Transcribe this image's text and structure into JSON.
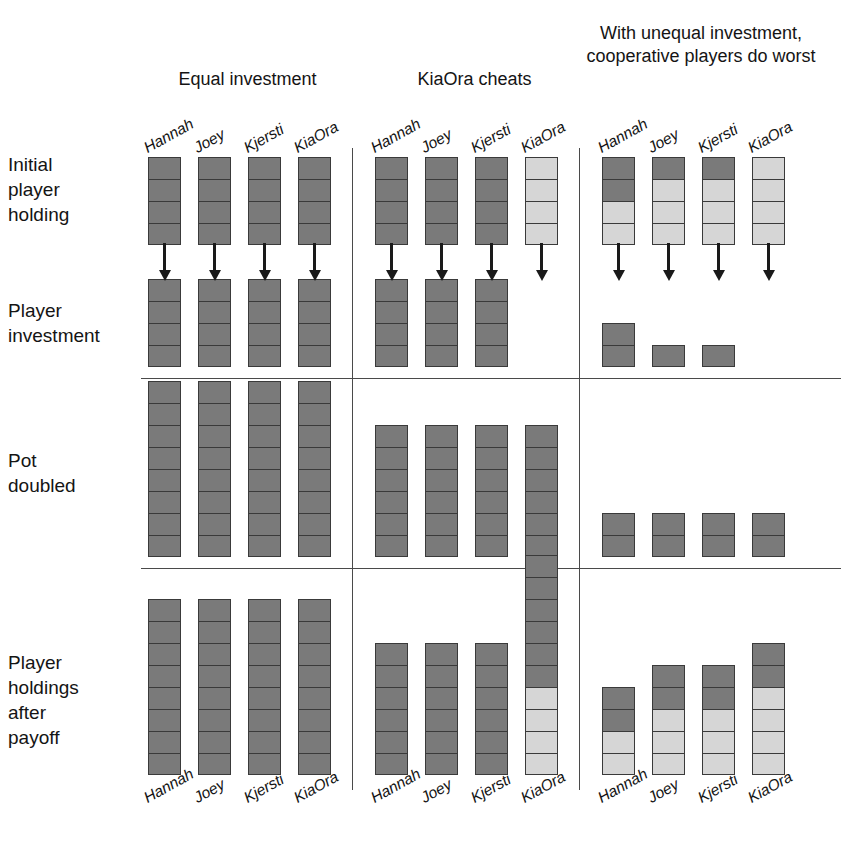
{
  "figure": {
    "colors": {
      "dark_token": "#7a7a7a",
      "light_token": "#d6d6d6",
      "token_border": "#3a3a3a",
      "rule": "#4a4a4a",
      "text": "#141414"
    },
    "panels": [
      {
        "id": "equal-investment",
        "title": "Equal investment",
        "players": [
          "Hannah",
          "Joey",
          "Kjersti",
          "KiaOra"
        ],
        "rows": {
          "initial_holding": [
            {
              "player": "Hannah",
              "dark": 4,
              "light": 0,
              "total": 4
            },
            {
              "player": "Joey",
              "dark": 4,
              "light": 0,
              "total": 4
            },
            {
              "player": "Kjersti",
              "dark": 4,
              "light": 0,
              "total": 4
            },
            {
              "player": "KiaOra",
              "dark": 4,
              "light": 0,
              "total": 4
            }
          ],
          "player_investment": [
            {
              "player": "Hannah",
              "dark": 4,
              "light": 0,
              "total": 4
            },
            {
              "player": "Joey",
              "dark": 4,
              "light": 0,
              "total": 4
            },
            {
              "player": "Kjersti",
              "dark": 4,
              "light": 0,
              "total": 4
            },
            {
              "player": "KiaOra",
              "dark": 4,
              "light": 0,
              "total": 4
            }
          ],
          "pot_doubled": [
            {
              "player": "Hannah",
              "dark": 8,
              "light": 0,
              "total": 8
            },
            {
              "player": "Joey",
              "dark": 8,
              "light": 0,
              "total": 8
            },
            {
              "player": "Kjersti",
              "dark": 8,
              "light": 0,
              "total": 8
            },
            {
              "player": "KiaOra",
              "dark": 8,
              "light": 0,
              "total": 8
            }
          ],
          "holdings_after_payoff": [
            {
              "player": "Hannah",
              "dark": 8,
              "light": 0,
              "total": 8
            },
            {
              "player": "Joey",
              "dark": 8,
              "light": 0,
              "total": 8
            },
            {
              "player": "Kjersti",
              "dark": 8,
              "light": 0,
              "total": 8
            },
            {
              "player": "KiaOra",
              "dark": 8,
              "light": 0,
              "total": 8
            }
          ]
        },
        "arrows": [
          true,
          true,
          true,
          true
        ]
      },
      {
        "id": "kiaora-cheats",
        "title": "KiaOra cheats",
        "players": [
          "Hannah",
          "Joey",
          "Kjersti",
          "KiaOra"
        ],
        "rows": {
          "initial_holding": [
            {
              "player": "Hannah",
              "dark": 4,
              "light": 0,
              "total": 4
            },
            {
              "player": "Joey",
              "dark": 4,
              "light": 0,
              "total": 4
            },
            {
              "player": "Kjersti",
              "dark": 4,
              "light": 0,
              "total": 4
            },
            {
              "player": "KiaOra",
              "dark": 0,
              "light": 4,
              "total": 4
            }
          ],
          "player_investment": [
            {
              "player": "Hannah",
              "dark": 4,
              "light": 0,
              "total": 4
            },
            {
              "player": "Joey",
              "dark": 4,
              "light": 0,
              "total": 4
            },
            {
              "player": "Kjersti",
              "dark": 4,
              "light": 0,
              "total": 4
            },
            {
              "player": "KiaOra",
              "dark": 0,
              "light": 0,
              "total": 0
            }
          ],
          "pot_doubled": [
            {
              "player": "Hannah",
              "dark": 6,
              "light": 0,
              "total": 6
            },
            {
              "player": "Joey",
              "dark": 6,
              "light": 0,
              "total": 6
            },
            {
              "player": "Kjersti",
              "dark": 6,
              "light": 0,
              "total": 6
            },
            {
              "player": "KiaOra",
              "dark": 6,
              "light": 0,
              "total": 6
            }
          ],
          "holdings_after_payoff": [
            {
              "player": "Hannah",
              "dark": 6,
              "light": 0,
              "total": 6
            },
            {
              "player": "Joey",
              "dark": 6,
              "light": 0,
              "total": 6
            },
            {
              "player": "Kjersti",
              "dark": 6,
              "light": 0,
              "total": 6
            },
            {
              "player": "KiaOra",
              "dark": 6,
              "light": 4,
              "total": 10
            }
          ]
        },
        "arrows": [
          true,
          true,
          true,
          true
        ]
      },
      {
        "id": "unequal-investment",
        "title": "With unequal investment, cooperative players do worst",
        "players": [
          "Hannah",
          "Joey",
          "Kjersti",
          "KiaOra"
        ],
        "rows": {
          "initial_holding": [
            {
              "player": "Hannah",
              "dark": 2,
              "light": 2,
              "total": 4
            },
            {
              "player": "Joey",
              "dark": 1,
              "light": 3,
              "total": 4
            },
            {
              "player": "Kjersti",
              "dark": 1,
              "light": 3,
              "total": 4
            },
            {
              "player": "KiaOra",
              "dark": 0,
              "light": 4,
              "total": 4
            }
          ],
          "player_investment": [
            {
              "player": "Hannah",
              "dark": 2,
              "light": 0,
              "total": 2
            },
            {
              "player": "Joey",
              "dark": 1,
              "light": 0,
              "total": 1
            },
            {
              "player": "Kjersti",
              "dark": 1,
              "light": 0,
              "total": 1
            },
            {
              "player": "KiaOra",
              "dark": 0,
              "light": 0,
              "total": 0
            }
          ],
          "pot_doubled": [
            {
              "player": "Hannah",
              "dark": 2,
              "light": 0,
              "total": 2
            },
            {
              "player": "Joey",
              "dark": 2,
              "light": 0,
              "total": 2
            },
            {
              "player": "Kjersti",
              "dark": 2,
              "light": 0,
              "total": 2
            },
            {
              "player": "KiaOra",
              "dark": 2,
              "light": 0,
              "total": 2
            }
          ],
          "holdings_after_payoff": [
            {
              "player": "Hannah",
              "dark": 2,
              "light": 2,
              "total": 4
            },
            {
              "player": "Joey",
              "dark": 2,
              "light": 3,
              "total": 5
            },
            {
              "player": "Kjersti",
              "dark": 2,
              "light": 3,
              "total": 5
            },
            {
              "player": "KiaOra",
              "dark": 2,
              "light": 4,
              "total": 6
            }
          ]
        },
        "arrows": [
          true,
          true,
          true,
          true
        ]
      }
    ],
    "row_labels": [
      {
        "id": "initial-player-holding",
        "text": "Initial\nplayer\nholding"
      },
      {
        "id": "player-investment",
        "text": "Player\ninvestment"
      },
      {
        "id": "pot-doubled",
        "text": "Pot\ndoubled"
      },
      {
        "id": "player-holdings-after-payoff",
        "text": "Player\nholdings\nafter\npayoff"
      }
    ],
    "bottom_player_labels": [
      "Hannah",
      "Joey",
      "Kjersti",
      "KiaOra",
      "Hannah",
      "Joey",
      "Kjersti",
      "KiaOra",
      "Hannah",
      "Joey",
      "Kjersti",
      "KiaOra"
    ],
    "top_player_labels": [
      "Hannah",
      "Joey",
      "Kjersti",
      "KiaOra",
      "Hannah",
      "Joey",
      "Kjersti",
      "KiaOra",
      "Hannah",
      "Joey",
      "Kjersti",
      "KiaOra"
    ]
  }
}
